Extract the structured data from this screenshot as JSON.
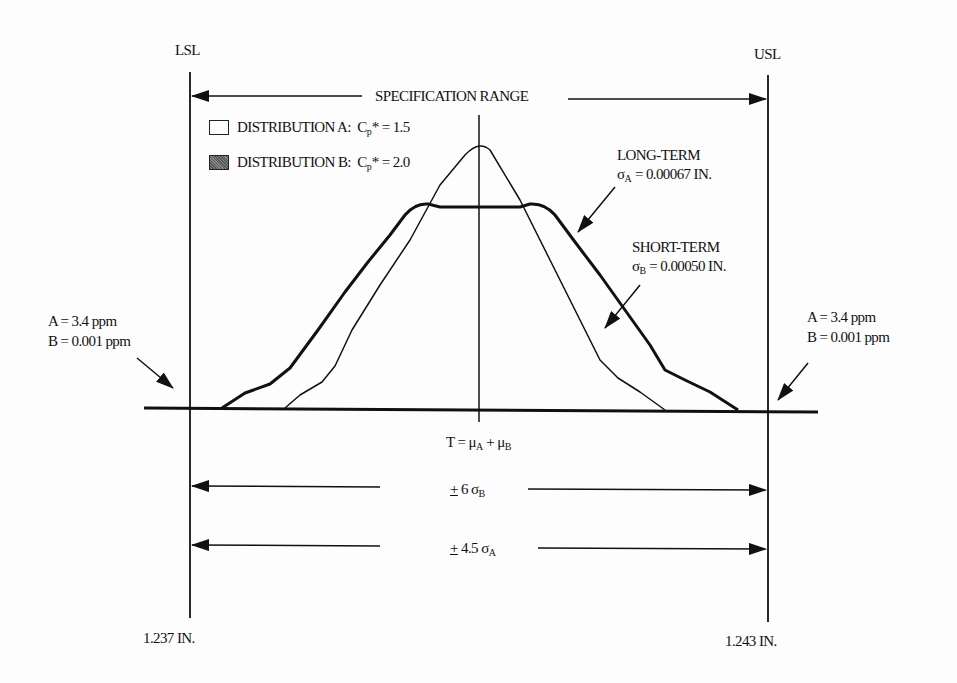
{
  "diagram": {
    "type": "process capability distribution comparison",
    "limits": {
      "lsl_label": "LSL",
      "usl_label": "USL",
      "lsl_value": "1.237 IN.",
      "usl_value": "1.243 IN."
    },
    "spec_range_label": "SPECIFICATION RANGE",
    "legend": [
      {
        "id": "A",
        "label": "DISTRIBUTION A:",
        "cp_symbol": "C",
        "cp_sub": "p",
        "cp_star": "* = 1.5",
        "fill": "white"
      },
      {
        "id": "B",
        "label": "DISTRIBUTION B:",
        "cp_symbol": "C",
        "cp_sub": "p",
        "cp_star": "* = 2.0",
        "fill": "shaded"
      }
    ],
    "annotations": {
      "long_term_title": "LONG-TERM",
      "long_term_sigma": "σ",
      "long_term_sub": "A",
      "long_term_value": " = 0.00067 IN.",
      "short_term_title": "SHORT-TERM",
      "short_term_sigma": "σ",
      "short_term_sub": "B",
      "short_term_value": " = 0.00050 IN.",
      "left_tail_a": "A = 3.4 ppm",
      "left_tail_b": "B = 0.001 ppm",
      "right_tail_a": "A = 3.4 ppm",
      "right_tail_b": "B = 0.001 ppm"
    },
    "target": {
      "prefix": "T = μ",
      "sub_a": "A",
      "plus": " + μ",
      "sub_b": "B"
    },
    "dimensions": [
      {
        "pm": "+",
        "text": " 6 σ",
        "sub": "B"
      },
      {
        "pm": "+",
        "text": " 4.5 σ",
        "sub": "A"
      }
    ],
    "colors": {
      "line": "#111111",
      "background": "#fdfdfd"
    }
  }
}
